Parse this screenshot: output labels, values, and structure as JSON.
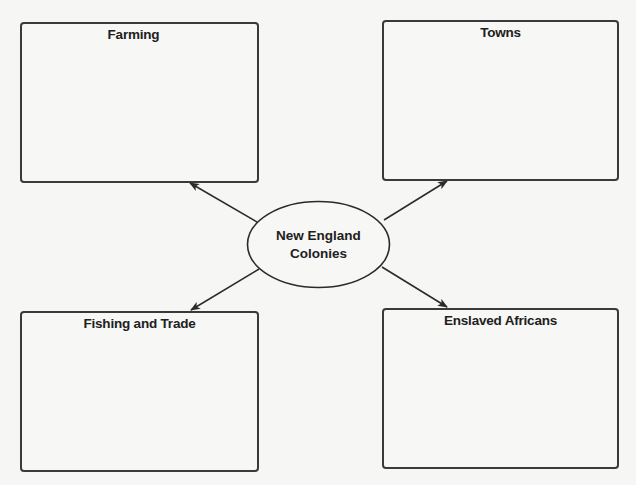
{
  "diagram": {
    "type": "concept-web",
    "center": {
      "label_line1": "New England",
      "label_line2": "Colonies"
    },
    "nodes": [
      {
        "id": "farming",
        "title": "Farming",
        "content": ""
      },
      {
        "id": "towns",
        "title": "Towns",
        "content": ""
      },
      {
        "id": "fishing",
        "title": "Fishing and Trade",
        "content": ""
      },
      {
        "id": "enslaved",
        "title": "Enslaved Africans",
        "content": ""
      }
    ],
    "edges": [
      {
        "from": "center",
        "to": "farming",
        "arrow": "to"
      },
      {
        "from": "center",
        "to": "towns",
        "arrow": "to"
      },
      {
        "from": "center",
        "to": "fishing",
        "arrow": "to"
      },
      {
        "from": "center",
        "to": "enslaved",
        "arrow": "to"
      }
    ],
    "colors": {
      "stroke": "#2a2a2a",
      "background": "#f6f6f4",
      "text": "#202020"
    }
  }
}
